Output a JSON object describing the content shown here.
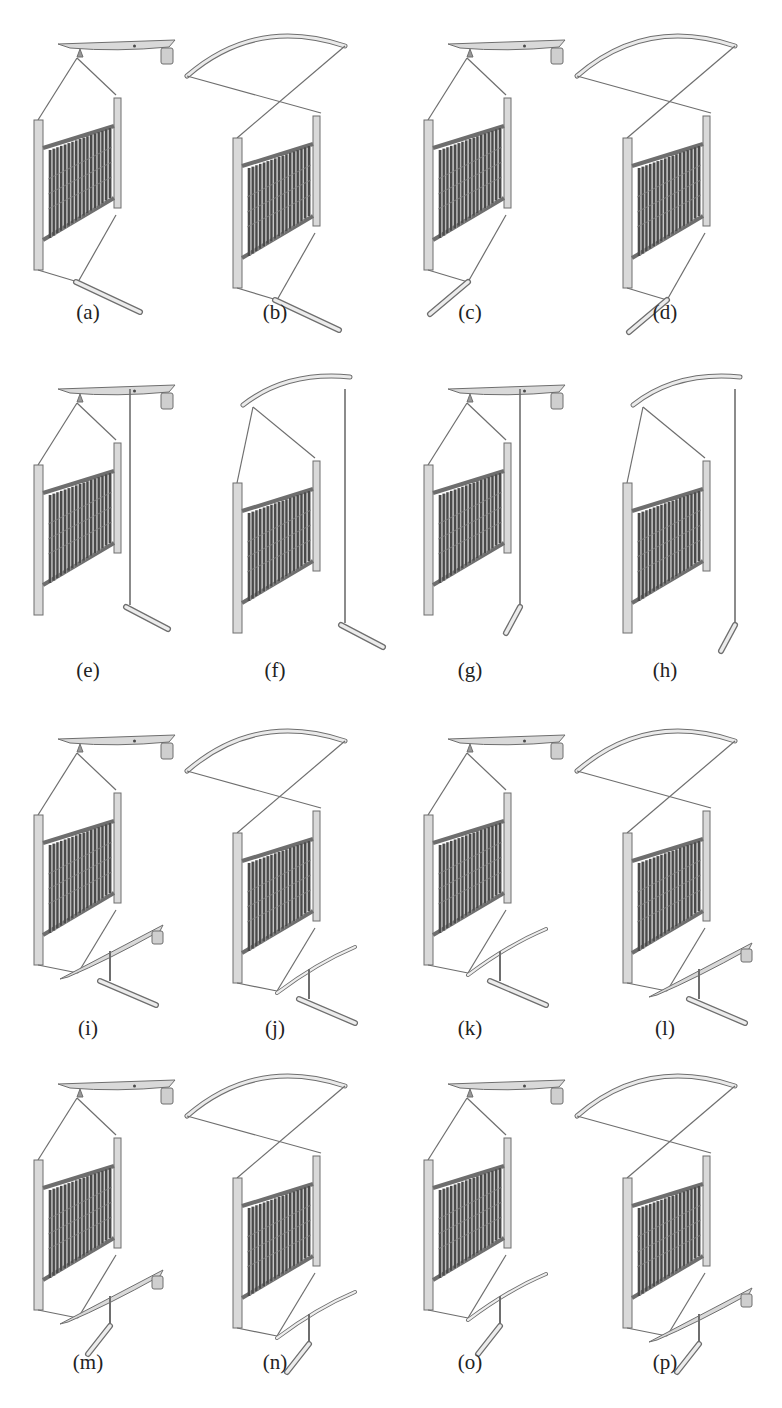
{
  "figure": {
    "panels": [
      {
        "id": "a",
        "label": "(a)",
        "top": "straight-weight",
        "bottom": "link-foot"
      },
      {
        "id": "b",
        "label": "(b)",
        "top": "curved-arch",
        "bottom": "link-foot"
      },
      {
        "id": "c",
        "label": "(c)",
        "top": "straight-weight",
        "bottom": "link-foot-left"
      },
      {
        "id": "d",
        "label": "(d)",
        "top": "curved-arch",
        "bottom": "link-foot-left"
      },
      {
        "id": "e",
        "label": "(e)",
        "top": "straight-weight",
        "bottom": "vertical-rod-foot"
      },
      {
        "id": "f",
        "label": "(f)",
        "top": "curved-short",
        "bottom": "vertical-rod-foot"
      },
      {
        "id": "g",
        "label": "(g)",
        "top": "straight-weight",
        "bottom": "vertical-rod-foot-left"
      },
      {
        "id": "h",
        "label": "(h)",
        "top": "curved-short",
        "bottom": "vertical-rod-foot-left"
      },
      {
        "id": "i",
        "label": "(i)",
        "top": "straight-weight",
        "bottom": "lever-weight-foot"
      },
      {
        "id": "j",
        "label": "(j)",
        "top": "curved-arch",
        "bottom": "curved-lever-foot"
      },
      {
        "id": "k",
        "label": "(k)",
        "top": "straight-weight",
        "bottom": "curved-lever-foot"
      },
      {
        "id": "l",
        "label": "(l)",
        "top": "curved-arch",
        "bottom": "lever-weight-foot"
      },
      {
        "id": "m",
        "label": "(m)",
        "top": "straight-weight",
        "bottom": "lever-weight-foot-left"
      },
      {
        "id": "n",
        "label": "(n)",
        "top": "curved-arch",
        "bottom": "curved-lever-foot-left"
      },
      {
        "id": "o",
        "label": "(o)",
        "top": "straight-weight",
        "bottom": "curved-lever-foot-left"
      },
      {
        "id": "p",
        "label": "(p)",
        "top": "curved-arch",
        "bottom": "lever-weight-foot-left"
      }
    ]
  }
}
